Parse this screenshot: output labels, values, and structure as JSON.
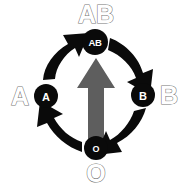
{
  "diagram": {
    "background_color": "#ffffff",
    "node_fill": "#0a0a0a",
    "node_text_color": "#ffffff",
    "cycle_arrow_color": "#0a0a0a",
    "center_arrow_color": "#5e5e5e",
    "outer_label_outline_color": "#777777",
    "outer_label_fill_color": "#ffffff",
    "cycle_direction": "clockwise",
    "nodes": [
      {
        "id": "node-ab",
        "label": "AB",
        "position": "top",
        "cx": 95,
        "cy": 42,
        "r": 13
      },
      {
        "id": "node-b",
        "label": "B",
        "position": "right",
        "cx": 143,
        "cy": 95,
        "r": 12
      },
      {
        "id": "node-o",
        "label": "O",
        "position": "bottom",
        "cx": 96,
        "cy": 148,
        "r": 12
      },
      {
        "id": "node-a",
        "label": "A",
        "position": "left",
        "cx": 46,
        "cy": 96,
        "r": 12
      }
    ],
    "outer_labels": [
      {
        "id": "outer-label-ab",
        "text": "AB",
        "position": "top",
        "x": 96,
        "y": 14,
        "size": 25
      },
      {
        "id": "outer-label-b",
        "text": "B",
        "position": "right",
        "x": 169,
        "y": 95,
        "size": 25
      },
      {
        "id": "outer-label-o",
        "text": "O",
        "position": "bottom",
        "x": 96,
        "y": 173,
        "size": 25
      },
      {
        "id": "outer-label-a",
        "text": "A",
        "position": "left",
        "x": 20,
        "y": 96,
        "size": 25
      }
    ],
    "cycle_arrows": [
      {
        "id": "arrow-a-to-ab",
        "from": "A",
        "to": "AB",
        "segment": "top-left"
      },
      {
        "id": "arrow-ab-to-b",
        "from": "AB",
        "to": "B",
        "segment": "top-right"
      },
      {
        "id": "arrow-b-to-o",
        "from": "B",
        "to": "O",
        "segment": "bottom-right"
      },
      {
        "id": "arrow-o-to-a",
        "from": "O",
        "to": "A",
        "segment": "bottom-left"
      }
    ],
    "center_arrow": {
      "id": "center-arrow",
      "direction": "up"
    }
  }
}
